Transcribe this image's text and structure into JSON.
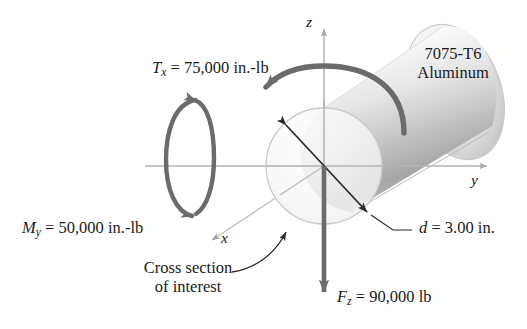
{
  "figure": {
    "material_note": {
      "line1": "7075-T6",
      "line2": "Aluminum"
    },
    "axes": [
      {
        "name": "z",
        "label": "z",
        "direction": "up"
      },
      {
        "name": "y",
        "label": "y",
        "direction": "right"
      },
      {
        "name": "x",
        "label": "x",
        "direction": "down-left"
      }
    ],
    "loads": [
      {
        "name": "torque",
        "symbol": "T",
        "subscript": "x",
        "equals": "=",
        "value": "75,000",
        "units": "in.-lb",
        "full_text": "T_x = 75,000 in.-lb"
      },
      {
        "name": "bending-moment",
        "symbol": "M",
        "subscript": "y",
        "equals": "=",
        "value": "50,000",
        "units": "in.-lb",
        "full_text": "M_y = 50,000 in.-lb"
      },
      {
        "name": "axial-force",
        "symbol": "F",
        "subscript": "z",
        "equals": "=",
        "value": "90,000",
        "units": "lb",
        "full_text": "F_z = 90,000 lb"
      }
    ],
    "dimension": {
      "name": "diameter",
      "symbol": "d",
      "equals": "=",
      "value": "3.00",
      "units": "in.",
      "full_text": "d = 3.00 in."
    },
    "callout": {
      "line1": "Cross section",
      "line2": "of interest"
    },
    "colors": {
      "load_arrow": "#6b6b6b",
      "axis_line": "#b3b3b3",
      "dimension_arrow": "#2b2b2b",
      "text": "#1a1a1a",
      "cylinder_light": "#ffffff",
      "cylinder_mid": "#d7d7d7",
      "cylinder_dark": "#9a9a9a",
      "cross_section_fill": "#f4f4f4",
      "cross_section_stroke": "#c9c9c9"
    }
  }
}
